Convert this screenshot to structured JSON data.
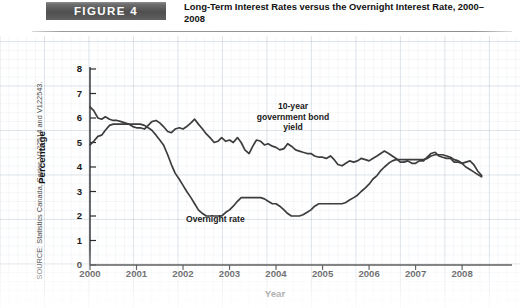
{
  "figure": {
    "badge_label": "FIGURE 4",
    "title": "Long-Term Interest Rates versus the Overnight Interest Rate, 2000–2008",
    "source_note": "SOURCE: Statistics Canada, Series V122514 and V122543."
  },
  "chart_data": {
    "type": "line",
    "title": "Long-Term Interest Rates versus the Overnight Interest Rate, 2000–2008",
    "xlabel": "Year",
    "ylabel": "Percentage",
    "xlim": [
      2000,
      2008.6
    ],
    "ylim": [
      0,
      8
    ],
    "yticks": [
      0,
      1,
      2,
      3,
      4,
      5,
      6,
      7,
      8
    ],
    "xticks": [
      2000,
      2001,
      2002,
      2003,
      2004,
      2005,
      2006,
      2007,
      2008
    ],
    "grid": true,
    "legend": "annotations-on-plot",
    "line_color": "#3d3d3d",
    "annotations": [
      {
        "name": "bond-yield-annotation",
        "text": "10-year\ngovernment bond\nyield",
        "line1": "10-year",
        "line2": "government bond",
        "line3": "yield"
      },
      {
        "name": "overnight-rate-annotation",
        "text": "Overnight rate"
      }
    ],
    "series": [
      {
        "name": "10-year government bond yield",
        "color": "#3d3d3d",
        "x": [
          2000.0,
          2000.08,
          2000.17,
          2000.25,
          2000.33,
          2000.42,
          2000.5,
          2000.58,
          2000.67,
          2000.75,
          2000.83,
          2000.92,
          2001.0,
          2001.08,
          2001.17,
          2001.25,
          2001.33,
          2001.42,
          2001.5,
          2001.58,
          2001.67,
          2001.75,
          2001.83,
          2001.92,
          2002.0,
          2002.08,
          2002.17,
          2002.25,
          2002.33,
          2002.42,
          2002.5,
          2002.58,
          2002.67,
          2002.75,
          2002.83,
          2002.92,
          2003.0,
          2003.08,
          2003.17,
          2003.25,
          2003.33,
          2003.42,
          2003.5,
          2003.58,
          2003.67,
          2003.75,
          2003.83,
          2003.92,
          2004.0,
          2004.08,
          2004.17,
          2004.25,
          2004.33,
          2004.42,
          2004.5,
          2004.58,
          2004.67,
          2004.75,
          2004.83,
          2004.92,
          2005.0,
          2005.08,
          2005.17,
          2005.25,
          2005.33,
          2005.42,
          2005.5,
          2005.58,
          2005.67,
          2005.75,
          2005.83,
          2005.92,
          2006.0,
          2006.08,
          2006.17,
          2006.25,
          2006.33,
          2006.42,
          2006.5,
          2006.58,
          2006.67,
          2006.75,
          2006.83,
          2006.92,
          2007.0,
          2007.08,
          2007.17,
          2007.25,
          2007.33,
          2007.42,
          2007.5,
          2007.58,
          2007.67,
          2007.75,
          2007.83,
          2007.92,
          2008.0,
          2008.08,
          2008.17,
          2008.25,
          2008.33,
          2008.42
        ],
        "y": [
          6.45,
          6.3,
          6.0,
          5.95,
          6.05,
          5.95,
          5.9,
          5.9,
          5.85,
          5.8,
          5.75,
          5.65,
          5.6,
          5.6,
          5.55,
          5.7,
          5.85,
          5.9,
          5.8,
          5.65,
          5.45,
          5.4,
          5.55,
          5.6,
          5.55,
          5.65,
          5.8,
          5.95,
          5.75,
          5.55,
          5.35,
          5.2,
          5.0,
          5.05,
          5.2,
          5.05,
          5.1,
          5.0,
          5.2,
          5.0,
          4.7,
          4.55,
          4.85,
          5.1,
          5.05,
          4.9,
          4.95,
          4.85,
          4.8,
          4.7,
          4.75,
          4.95,
          4.85,
          4.7,
          4.65,
          4.6,
          4.55,
          4.55,
          4.45,
          4.4,
          4.4,
          4.35,
          4.45,
          4.3,
          4.1,
          4.05,
          4.15,
          4.25,
          4.2,
          4.25,
          4.35,
          4.3,
          4.25,
          4.35,
          4.45,
          4.55,
          4.65,
          4.55,
          4.45,
          4.35,
          4.2,
          4.2,
          4.25,
          4.15,
          4.15,
          4.25,
          4.25,
          4.4,
          4.55,
          4.6,
          4.45,
          4.4,
          4.35,
          4.35,
          4.2,
          4.2,
          4.15,
          4.2,
          4.25,
          4.1,
          3.85,
          3.65
        ]
      },
      {
        "name": "Overnight rate",
        "color": "#3d3d3d",
        "x": [
          2000.0,
          2000.08,
          2000.17,
          2000.25,
          2000.33,
          2000.42,
          2000.5,
          2000.58,
          2000.67,
          2000.75,
          2000.83,
          2000.92,
          2001.0,
          2001.08,
          2001.17,
          2001.25,
          2001.33,
          2001.42,
          2001.5,
          2001.58,
          2001.67,
          2001.75,
          2001.83,
          2001.92,
          2002.0,
          2002.08,
          2002.17,
          2002.25,
          2002.33,
          2002.42,
          2002.5,
          2002.58,
          2002.67,
          2002.75,
          2002.83,
          2002.92,
          2003.0,
          2003.08,
          2003.17,
          2003.25,
          2003.33,
          2003.42,
          2003.5,
          2003.58,
          2003.67,
          2003.75,
          2003.83,
          2003.92,
          2004.0,
          2004.08,
          2004.17,
          2004.25,
          2004.33,
          2004.42,
          2004.5,
          2004.58,
          2004.67,
          2004.75,
          2004.83,
          2004.92,
          2005.0,
          2005.08,
          2005.17,
          2005.25,
          2005.33,
          2005.42,
          2005.5,
          2005.58,
          2005.67,
          2005.75,
          2005.83,
          2005.92,
          2006.0,
          2006.08,
          2006.17,
          2006.25,
          2006.33,
          2006.42,
          2006.5,
          2006.58,
          2006.67,
          2006.75,
          2006.83,
          2006.92,
          2007.0,
          2007.08,
          2007.17,
          2007.25,
          2007.33,
          2007.42,
          2007.5,
          2007.58,
          2007.67,
          2007.75,
          2007.83,
          2007.92,
          2008.0,
          2008.08,
          2008.17,
          2008.25,
          2008.33,
          2008.42
        ],
        "y": [
          4.9,
          5.05,
          5.25,
          5.3,
          5.5,
          5.7,
          5.75,
          5.75,
          5.75,
          5.75,
          5.75,
          5.75,
          5.75,
          5.75,
          5.7,
          5.6,
          5.5,
          5.3,
          5.1,
          4.9,
          4.5,
          4.1,
          3.75,
          3.5,
          3.25,
          3.0,
          2.75,
          2.5,
          2.25,
          2.1,
          2.0,
          2.0,
          2.0,
          2.0,
          2.0,
          2.15,
          2.25,
          2.4,
          2.6,
          2.75,
          2.75,
          2.75,
          2.75,
          2.75,
          2.75,
          2.7,
          2.6,
          2.5,
          2.5,
          2.4,
          2.25,
          2.1,
          2.0,
          2.0,
          2.0,
          2.05,
          2.15,
          2.25,
          2.4,
          2.5,
          2.5,
          2.5,
          2.5,
          2.5,
          2.5,
          2.5,
          2.55,
          2.65,
          2.75,
          2.85,
          3.0,
          3.15,
          3.3,
          3.5,
          3.65,
          3.85,
          4.0,
          4.15,
          4.25,
          4.3,
          4.3,
          4.3,
          4.3,
          4.3,
          4.3,
          4.3,
          4.3,
          4.35,
          4.45,
          4.5,
          4.5,
          4.5,
          4.45,
          4.4,
          4.3,
          4.25,
          4.15,
          4.0,
          3.9,
          3.8,
          3.7,
          3.6
        ]
      }
    ]
  }
}
